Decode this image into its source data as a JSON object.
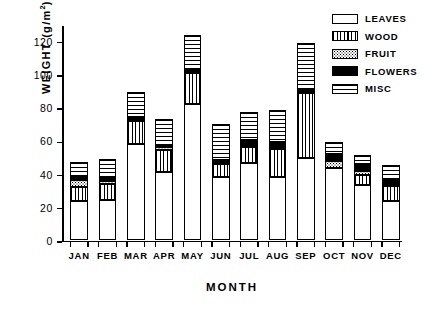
{
  "chart_data": {
    "type": "bar",
    "subtype": "stacked-bar",
    "title": "",
    "xlabel": "MONTH",
    "ylabel": "WEIGHT (g/m2)",
    "ylabel_display": "WEIGHT (g/m",
    "ylabel_exponent": "2",
    "ylabel_suffix": ")",
    "ylim": [
      0,
      130
    ],
    "yticks": [
      0,
      20,
      40,
      60,
      80,
      100,
      120
    ],
    "ytick_labels": [
      "0",
      "20",
      "40",
      "60",
      "80",
      "100",
      "120"
    ],
    "grid": false,
    "legend_position": "top-right",
    "categories": [
      "JAN",
      "FEB",
      "MAR",
      "APR",
      "MAY",
      "JUN",
      "JUL",
      "AUG",
      "SEP",
      "OCT",
      "NOV",
      "DEC"
    ],
    "series": [
      {
        "name": "LEAVES",
        "pattern": "empty-white",
        "values": [
          23.5,
          24.5,
          58.0,
          41.0,
          82.0,
          38.0,
          46.5,
          38.0,
          49.5,
          43.5,
          33.5,
          23.5
        ]
      },
      {
        "name": "WOOD",
        "pattern": "vertical-lines",
        "values": [
          8.5,
          9.5,
          14.0,
          13.5,
          19.0,
          8.0,
          9.5,
          17.0,
          39.5,
          0.0,
          6.0,
          9.5
        ]
      },
      {
        "name": "FRUIT",
        "pattern": "dotted",
        "values": [
          4.5,
          1.5,
          0.0,
          1.5,
          0.0,
          0.0,
          0.0,
          0.0,
          0.0,
          4.5,
          2.5,
          0.0
        ]
      },
      {
        "name": "FLOWERS",
        "pattern": "solid-black",
        "values": [
          2.0,
          2.5,
          2.0,
          1.5,
          1.5,
          2.5,
          4.5,
          4.0,
          1.5,
          4.0,
          4.0,
          3.5
        ]
      },
      {
        "name": "MISC",
        "pattern": "horizontal-dashes",
        "values": [
          8.5,
          11.0,
          15.5,
          15.5,
          21.0,
          21.5,
          17.0,
          19.5,
          28.5,
          7.5,
          5.5,
          9.0
        ]
      }
    ],
    "totals": [
      47.0,
      49.0,
      89.5,
      73.0,
      123.5,
      70.0,
      77.5,
      78.5,
      119.0,
      59.5,
      51.5,
      45.5
    ],
    "legend": [
      {
        "label": "LEAVES",
        "pattern": "empty-white"
      },
      {
        "label": "WOOD",
        "pattern": "vertical-lines"
      },
      {
        "label": "FRUIT",
        "pattern": "dotted"
      },
      {
        "label": "FLOWERS",
        "pattern": "solid-black"
      },
      {
        "label": "MISC",
        "pattern": "horizontal-dashes"
      }
    ],
    "colors": {
      "ink": "#000000",
      "background": "#ffffff"
    }
  }
}
